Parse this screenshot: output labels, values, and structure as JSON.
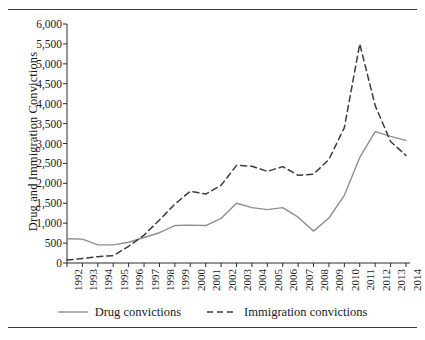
{
  "chart_data": {
    "type": "line",
    "title": "",
    "xlabel": "",
    "ylabel": "Drug and Immigration Convictions",
    "x": [
      1992,
      1993,
      1994,
      1995,
      1996,
      1997,
      1998,
      1999,
      2000,
      2001,
      2002,
      2003,
      2004,
      2005,
      2006,
      2007,
      2008,
      2009,
      2010,
      2011,
      2012,
      2013,
      2014
    ],
    "xtick_labels": [
      "1992",
      "1993",
      "1994",
      "1995",
      "1996",
      "1997",
      "1998",
      "1999",
      "2000",
      "2001",
      "2002",
      "2003",
      "2004",
      "2005",
      "2006",
      "2007",
      "2008",
      "2009",
      "2010",
      "2011",
      "2012",
      "2013",
      "2014"
    ],
    "ylim": [
      0,
      6000
    ],
    "ytick_values": [
      0,
      500,
      1000,
      1500,
      2000,
      2500,
      3000,
      3500,
      4000,
      4500,
      5000,
      5500,
      6000
    ],
    "ytick_labels": [
      "0",
      "500",
      "1,000",
      "1,500",
      "2,000",
      "2,500",
      "3,000",
      "3,500",
      "4,000",
      "4,500",
      "5,000",
      "5,500",
      "6,000"
    ],
    "grid": false,
    "legend_position": "bottom",
    "series": [
      {
        "name": "Drug convictions",
        "style": "solid",
        "color": "#8f8f8f",
        "values": [
          610,
          600,
          455,
          455,
          520,
          640,
          760,
          940,
          950,
          940,
          1120,
          1500,
          1390,
          1340,
          1390,
          1150,
          800,
          1130,
          1700,
          2650,
          3300,
          3180,
          3080
        ]
      },
      {
        "name": "Immigration convictions",
        "style": "dashed",
        "color": "#3c3c3c",
        "values": [
          75,
          110,
          160,
          185,
          420,
          700,
          1080,
          1480,
          1800,
          1730,
          1950,
          2450,
          2430,
          2300,
          2420,
          2200,
          2230,
          2600,
          3400,
          5500,
          3950,
          3050,
          2700
        ]
      }
    ]
  },
  "legend": {
    "items": [
      {
        "label": "Drug convictions",
        "style": "solid"
      },
      {
        "label": "Immigration convictions",
        "style": "dashed"
      }
    ]
  }
}
